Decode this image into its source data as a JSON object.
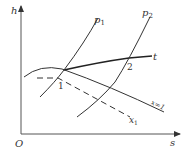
{
  "diagram": {
    "type": "thermodynamic h-s diagram",
    "axes": {
      "y_label": "h",
      "x_label": "s",
      "origin_label": "O"
    },
    "curves": [
      {
        "id": "p1",
        "label": "p",
        "subscript": "1",
        "style": "solid"
      },
      {
        "id": "p2",
        "label": "p",
        "subscript": "2",
        "style": "solid"
      },
      {
        "id": "t",
        "label": "t",
        "style": "solid-thick"
      },
      {
        "id": "x1-saturation",
        "label": "x=1",
        "style": "solid"
      },
      {
        "id": "x1",
        "label": "x",
        "subscript": "1",
        "style": "dashed"
      }
    ],
    "points": [
      {
        "id": "1",
        "label": "1"
      },
      {
        "id": "2",
        "label": "2"
      }
    ],
    "colors": {
      "line": "#333333",
      "background": "#ffffff"
    }
  }
}
